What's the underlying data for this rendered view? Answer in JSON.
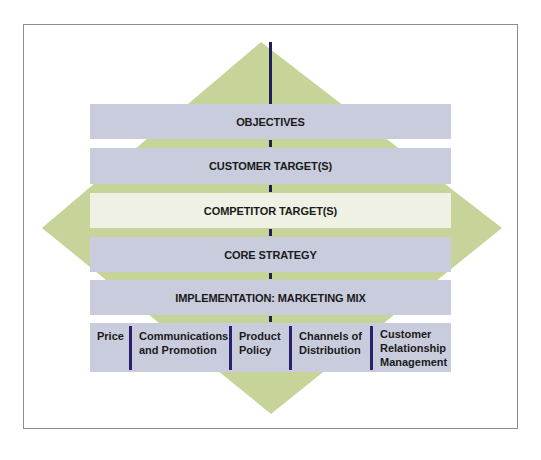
{
  "diagram": {
    "colors": {
      "diamond": "#c6d49a",
      "bar": "#c9ccdc",
      "bar_highlight": "#eef1e3",
      "connector": "#1f1f5a",
      "divider": "#2a226a",
      "frame_border": "#8c8c8c"
    },
    "levels": [
      {
        "label": "OBJECTIVES"
      },
      {
        "label": "CUSTOMER TARGET(S)"
      },
      {
        "label": "COMPETITOR TARGET(S)"
      },
      {
        "label": "CORE STRATEGY"
      },
      {
        "label": "IMPLEMENTATION: MARKETING MIX"
      }
    ],
    "marketing_mix": [
      {
        "label": "Price"
      },
      {
        "label": "Communications\nand Promotion"
      },
      {
        "label": "Product\nPolicy"
      },
      {
        "label": "Channels of\nDistribution"
      },
      {
        "label": "Customer\nRelationship\nManagement"
      }
    ]
  }
}
